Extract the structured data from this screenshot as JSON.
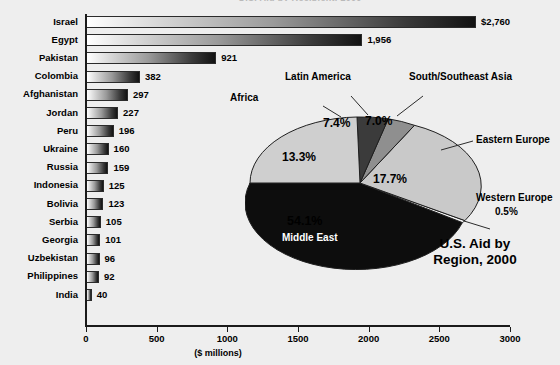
{
  "cut_title": "U.S. Aid by Recipient, 2000",
  "axis": {
    "x_label": "($ millions)",
    "x_ticks": [
      "0",
      "500",
      "1000",
      "1500",
      "2000",
      "2500",
      "3000"
    ],
    "x_min": 0,
    "x_max": 3000
  },
  "pie": {
    "title_line1": "U.S. Aid by",
    "title_line2": "Region, 2000",
    "callouts": [
      {
        "name": "latin-america",
        "label": "Latin America"
      },
      {
        "name": "south-southeast-asia",
        "label": "South/Southeast Asia"
      },
      {
        "name": "africa",
        "label": "Africa"
      },
      {
        "name": "eastern-europe",
        "label": "Eastern Europe"
      },
      {
        "name": "western-europe",
        "label": "Western Europe"
      },
      {
        "name": "middle-east",
        "label": "Middle East"
      }
    ],
    "pcts": {
      "latin_america": "7.4%",
      "south_southeast_asia": "7.0%",
      "africa": "13.3%",
      "eastern_europe": "17.7%",
      "western_europe": "0.5%",
      "middle_east": "54.1%"
    }
  },
  "chart_data": [
    {
      "type": "bar",
      "orientation": "horizontal",
      "title": "U.S. Aid by Recipient, 2000",
      "xlabel": "($ millions)",
      "ylabel": "",
      "xlim": [
        0,
        3000
      ],
      "xticks": [
        0,
        500,
        1000,
        1500,
        2000,
        2500,
        3000
      ],
      "grid": false,
      "categories": [
        "Israel",
        "Egypt",
        "Pakistan",
        "Colombia",
        "Afghanistan",
        "Jordan",
        "Peru",
        "Ukraine",
        "Russia",
        "Indonesia",
        "Bolivia",
        "Serbia",
        "Georgia",
        "Uzbekistan",
        "Philippines",
        "India"
      ],
      "values": [
        2760,
        1956,
        921,
        382,
        297,
        227,
        196,
        160,
        159,
        125,
        123,
        105,
        101,
        96,
        92,
        40
      ],
      "value_labels": [
        "$2,760",
        "1,956",
        "921",
        "382",
        "297",
        "227",
        "196",
        "160",
        "159",
        "125",
        "123",
        "105",
        "101",
        "96",
        "92",
        "40"
      ]
    },
    {
      "type": "pie",
      "title": "U.S. Aid by Region, 2000",
      "labels": [
        "Middle East",
        "Eastern Europe",
        "Africa",
        "Latin America",
        "South/Southeast Asia",
        "Western Europe"
      ],
      "values": [
        54.1,
        17.7,
        13.3,
        7.4,
        7.0,
        0.5
      ],
      "value_labels": [
        "54.1%",
        "17.7%",
        "13.3%",
        "7.4%",
        "7.0%",
        "0.5%"
      ],
      "colors": [
        "#0d0d0d",
        "#c9c9c9",
        "#cfcfcf",
        "#3b3b3b",
        "#8f8f8f",
        "#f2f2f2"
      ],
      "legend": "callouts"
    }
  ]
}
